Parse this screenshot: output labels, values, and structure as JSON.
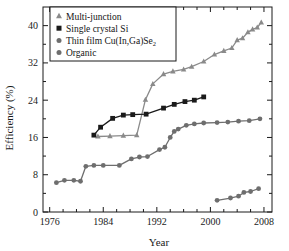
{
  "chart_data": {
    "type": "line",
    "title": "",
    "xlabel": "Year",
    "ylabel": "Efficiency (%)",
    "xlim": [
      1975.0,
      2009.2
    ],
    "ylim": [
      0,
      44
    ],
    "xticks": [
      1976,
      1984,
      1992,
      2000,
      2008
    ],
    "xtick_labels": [
      "1976",
      "1984",
      "1992",
      "2000",
      "2008"
    ],
    "yticks": [
      0,
      8,
      16,
      24,
      32,
      40
    ],
    "ytick_labels": [
      "0",
      "8",
      "16",
      "24",
      "32",
      "40"
    ],
    "x_minor_step": 2,
    "y_minor_step": 4,
    "grid": false,
    "legend_position": "top-left",
    "series": [
      {
        "name": "Multi-junction",
        "marker": "triangle",
        "color": "#8a8a8a",
        "points": [
          [
            1983.2,
            16.2
          ],
          [
            1985.0,
            16.3
          ],
          [
            1987.0,
            16.4
          ],
          [
            1989.0,
            16.5
          ],
          [
            1990.3,
            24.1
          ],
          [
            1991.4,
            27.5
          ],
          [
            1993.0,
            29.6
          ],
          [
            1994.4,
            30.2
          ],
          [
            1996.0,
            30.6
          ],
          [
            1997.2,
            31.2
          ],
          [
            1999.0,
            32.3
          ],
          [
            2000.6,
            33.8
          ],
          [
            2002.0,
            34.6
          ],
          [
            2003.2,
            35.2
          ],
          [
            2004.0,
            36.9
          ],
          [
            2004.8,
            37.3
          ],
          [
            2005.6,
            38.6
          ],
          [
            2006.3,
            39.2
          ],
          [
            2007.0,
            39.6
          ],
          [
            2007.6,
            40.7
          ]
        ]
      },
      {
        "name": "Single crystal Si",
        "marker": "square",
        "color": "#1a1a1a",
        "points": [
          [
            1982.6,
            16.5
          ],
          [
            1983.6,
            18.2
          ],
          [
            1985.4,
            20.1
          ],
          [
            1987.0,
            20.8
          ],
          [
            1988.4,
            20.9
          ],
          [
            1990.4,
            21.0
          ],
          [
            1993.0,
            22.3
          ],
          [
            1994.6,
            23.1
          ],
          [
            1996.2,
            23.7
          ],
          [
            1997.6,
            24.0
          ],
          [
            1999.0,
            24.7
          ]
        ]
      },
      {
        "name": "Thin film Cu(In,Ga)Se2",
        "marker": "circle",
        "color": "#6e6e6e",
        "points": [
          [
            1977.0,
            6.3
          ],
          [
            1978.2,
            6.8
          ],
          [
            1979.6,
            6.8
          ],
          [
            1980.6,
            6.6
          ],
          [
            1981.4,
            9.8
          ],
          [
            1982.6,
            10.0
          ],
          [
            1984.0,
            10.0
          ],
          [
            1986.4,
            10.0
          ],
          [
            1988.2,
            11.4
          ],
          [
            1989.4,
            11.8
          ],
          [
            1990.6,
            11.9
          ],
          [
            1992.4,
            13.4
          ],
          [
            1993.2,
            13.9
          ],
          [
            1994.0,
            16.0
          ],
          [
            1994.6,
            17.3
          ],
          [
            1995.2,
            17.8
          ],
          [
            1996.4,
            18.6
          ],
          [
            1997.6,
            18.9
          ],
          [
            1999.0,
            19.1
          ],
          [
            2001.0,
            19.2
          ],
          [
            2002.6,
            19.3
          ],
          [
            2004.2,
            19.5
          ],
          [
            2005.8,
            19.6
          ],
          [
            2007.4,
            20.0
          ]
        ]
      },
      {
        "name": "Organic",
        "marker": "circle",
        "color": "#6e6e6e",
        "points": [
          [
            2001.0,
            2.5
          ],
          [
            2003.0,
            3.0
          ],
          [
            2004.2,
            3.4
          ],
          [
            2005.0,
            4.2
          ],
          [
            2006.0,
            4.4
          ],
          [
            2007.2,
            5.0
          ]
        ]
      }
    ]
  },
  "legend": {
    "entries": [
      {
        "label": "Multi-junction",
        "marker": "triangle",
        "color": "#8a8a8a"
      },
      {
        "label": "Single crystal Si",
        "marker": "square",
        "color": "#1a1a1a"
      },
      {
        "label": "Thin film Cu(In,Ga)Se",
        "sub": "2",
        "marker": "circle",
        "color": "#6e6e6e"
      },
      {
        "label": "Organic",
        "marker": "circle",
        "color": "#6e6e6e"
      }
    ]
  },
  "colors": {
    "axis": "#1a1a1a",
    "background": "#ffffff",
    "multi_junction": "#8a8a8a",
    "single_crystal": "#1a1a1a",
    "thin_film": "#6e6e6e",
    "organic": "#6e6e6e"
  }
}
